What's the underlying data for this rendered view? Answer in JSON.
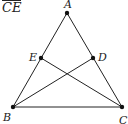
{
  "header": {
    "text": "CE",
    "overline": true
  },
  "diagram": {
    "points": [
      {
        "name": "A",
        "x": 67,
        "y": 13,
        "label_x": 64,
        "label_y": 8
      },
      {
        "name": "E",
        "x": 41,
        "y": 58,
        "label_x": 29,
        "label_y": 61
      },
      {
        "name": "D",
        "x": 93,
        "y": 58,
        "label_x": 99,
        "label_y": 61
      },
      {
        "name": "B",
        "x": 13,
        "y": 107,
        "label_x": 3,
        "label_y": 121
      },
      {
        "name": "C",
        "x": 122,
        "y": 107,
        "label_x": 119,
        "label_y": 124
      }
    ],
    "segments": [
      [
        "A",
        "B"
      ],
      [
        "A",
        "C"
      ],
      [
        "B",
        "C"
      ],
      [
        "B",
        "D"
      ],
      [
        "C",
        "E"
      ]
    ],
    "stroke_color": "#222222"
  }
}
